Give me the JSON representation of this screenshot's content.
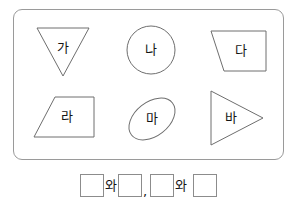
{
  "worksheet": {
    "panel": {
      "shapes": [
        {
          "id": "shape-a",
          "label": "가",
          "shape_type": "triangle-down"
        },
        {
          "id": "shape-b",
          "label": "나",
          "shape_type": "circle"
        },
        {
          "id": "shape-c",
          "label": "다",
          "shape_type": "trapezoid-right"
        },
        {
          "id": "shape-d",
          "label": "라",
          "shape_type": "trapezoid-left"
        },
        {
          "id": "shape-e",
          "label": "마",
          "shape_type": "ellipse-tilted"
        },
        {
          "id": "shape-f",
          "label": "바",
          "shape_type": "triangle-right"
        }
      ]
    },
    "answer": {
      "conjunction_1": "와",
      "separator": ",",
      "conjunction_2": "와",
      "blank_1": "",
      "blank_2": "",
      "blank_3": "",
      "blank_4": ""
    },
    "colors": {
      "panel_border": "#9a9a9a",
      "shape_stroke": "#6e6e6e",
      "blank_border": "#8c8c8c",
      "text": "#141414",
      "background": "#ffffff"
    }
  }
}
